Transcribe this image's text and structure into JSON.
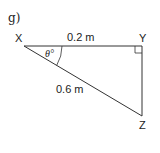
{
  "part_label": "g)",
  "triangle": {
    "vertices": {
      "X": {
        "label": "X"
      },
      "Y": {
        "label": "Y"
      },
      "Z": {
        "label": "Z"
      }
    },
    "sides": {
      "XY": {
        "label": "0.2 m"
      },
      "XZ": {
        "label": "0.6 m"
      }
    },
    "angle_at_X": {
      "symbol": "θ",
      "unit": "°",
      "display": "θ°"
    },
    "right_angle_at": "Y"
  },
  "colors": {
    "stroke": "#333333",
    "text": "#222222",
    "background": "#ffffff"
  }
}
